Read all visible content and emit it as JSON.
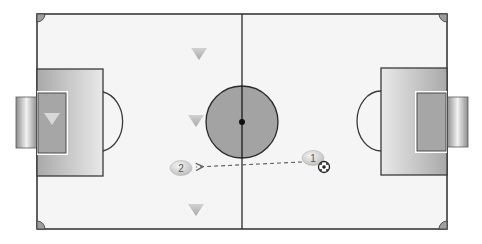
{
  "diagram": {
    "type": "soccer-pitch-tactic",
    "colors": {
      "background": "#ffffff",
      "pitch_fill": "#f4f4f4",
      "line": "#3a3a3a",
      "penalty_box_light": "#e8e8e8",
      "penalty_box_dark": "#a9a9a9",
      "goal_area": "#a6a6a6",
      "center_circle": "#a3a3a3",
      "corner": "#9e9e9e",
      "marker_fill": "#dcdcdc",
      "triangle": "#c2c2c2",
      "pass_line": "#666666"
    },
    "players": [
      {
        "id": "player-1",
        "label": "1",
        "x": 313,
        "y": 157,
        "has_ball": true
      },
      {
        "id": "player-2",
        "label": "2",
        "x": 181,
        "y": 168,
        "has_ball": false
      }
    ],
    "opponents": [
      {
        "id": "cone-1",
        "x": 199,
        "y": 53
      },
      {
        "id": "cone-2",
        "x": 196,
        "y": 120
      },
      {
        "id": "cone-3",
        "x": 196,
        "y": 209
      },
      {
        "id": "goalkeeper",
        "x": 52,
        "y": 118
      }
    ],
    "pass": {
      "from": "1",
      "to": "2",
      "style": "dashed"
    }
  }
}
